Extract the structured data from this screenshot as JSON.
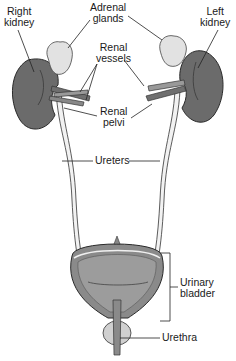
{
  "diagram": {
    "labels": {
      "right_kidney": [
        "Right",
        "kidney"
      ],
      "left_kidney": [
        "Left",
        "kidney"
      ],
      "adrenal_glands": [
        "Adrenal",
        "glands"
      ],
      "renal_vessels": [
        "Renal",
        "vessels"
      ],
      "renal_pelvi": [
        "Renal",
        "pelvi"
      ],
      "ureters": "Ureters",
      "urinary_bladder": [
        "Urinary",
        "bladder"
      ],
      "urethra": "Urethra"
    },
    "colors": {
      "kidney": "#6b6b6b",
      "kidney_outline": "#2a2a2a",
      "adrenal": "#e2e2e2",
      "vessel": "#7a7a7a",
      "ureter": "#ededed",
      "bladder_wall": "#8a8a8a",
      "bladder_inner": "#9c9c9c",
      "line": "#222222"
    }
  }
}
